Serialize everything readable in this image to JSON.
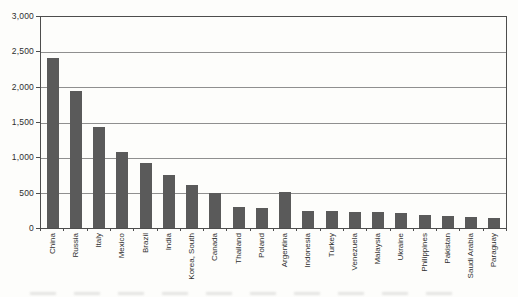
{
  "figure": {
    "background": "#fdfdfb",
    "bar_color": "#5a5a5a",
    "axis_color": "#4d4d4d",
    "grid_color": "#8f8f8f",
    "text_color": "#2e2e2e"
  },
  "chart_data": {
    "type": "bar",
    "title": "",
    "xlabel": "",
    "ylabel": "",
    "categories": [
      "China",
      "Russia",
      "Italy",
      "Mexico",
      "Brazil",
      "India",
      "Korea, South",
      "Canada",
      "Thailand",
      "Poland",
      "Argentina",
      "Indonesia",
      "Turkey",
      "Venezuela",
      "Malaysia",
      "Ukraine",
      "Philippines",
      "Pakistan",
      "Saudi Arabia",
      "Paraguay"
    ],
    "values": [
      2420,
      1950,
      1440,
      1075,
      925,
      750,
      610,
      500,
      305,
      280,
      505,
      245,
      235,
      225,
      230,
      220,
      185,
      170,
      155,
      145
    ],
    "ylim": [
      0,
      3000
    ],
    "ytick_interval": 500,
    "ytick_labels": [
      "0",
      "500",
      "1,000",
      "1,500",
      "2,000",
      "2,500",
      "3,000"
    ],
    "grid": true,
    "legend": "none"
  }
}
